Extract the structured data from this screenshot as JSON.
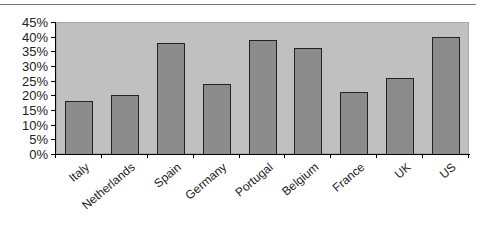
{
  "chart_data": {
    "type": "bar",
    "title": "",
    "xlabel": "",
    "ylabel": "",
    "categories": [
      "Italy",
      "Netherlands",
      "Spain",
      "Germany",
      "Portugal",
      "Belgium",
      "France",
      "UK",
      "US"
    ],
    "values": [
      18,
      20,
      38,
      24,
      39,
      36,
      21,
      26,
      40
    ],
    "ylim": [
      0,
      45
    ],
    "yticks": [
      "0%",
      "5%",
      "10%",
      "15%",
      "20%",
      "25%",
      "30%",
      "35%",
      "40%",
      "45%"
    ],
    "grid": false,
    "legend": null,
    "colors": {
      "bar": "#8c8c8c",
      "plot_bg": "#c0c0c0",
      "bar_border": "#222222"
    }
  }
}
